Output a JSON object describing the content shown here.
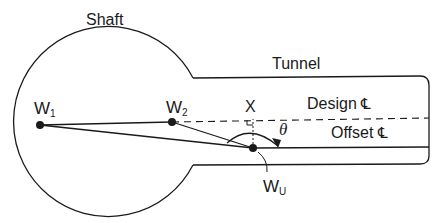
{
  "diagram": {
    "type": "survey-geometry",
    "labels": {
      "shaft": "Shaft",
      "tunnel": "Tunnel",
      "design_cl": "Design",
      "offset_cl": "Offset",
      "centerline_symbol": "℄",
      "point_x": "X",
      "theta": "θ"
    },
    "points": [
      {
        "id": "W1",
        "base": "W",
        "sub": "1"
      },
      {
        "id": "W2",
        "base": "W",
        "sub": "2"
      },
      {
        "id": "WU",
        "base": "W",
        "sub": "U"
      }
    ],
    "colors": {
      "stroke": "#1a1a1a",
      "background": "#ffffff"
    }
  }
}
